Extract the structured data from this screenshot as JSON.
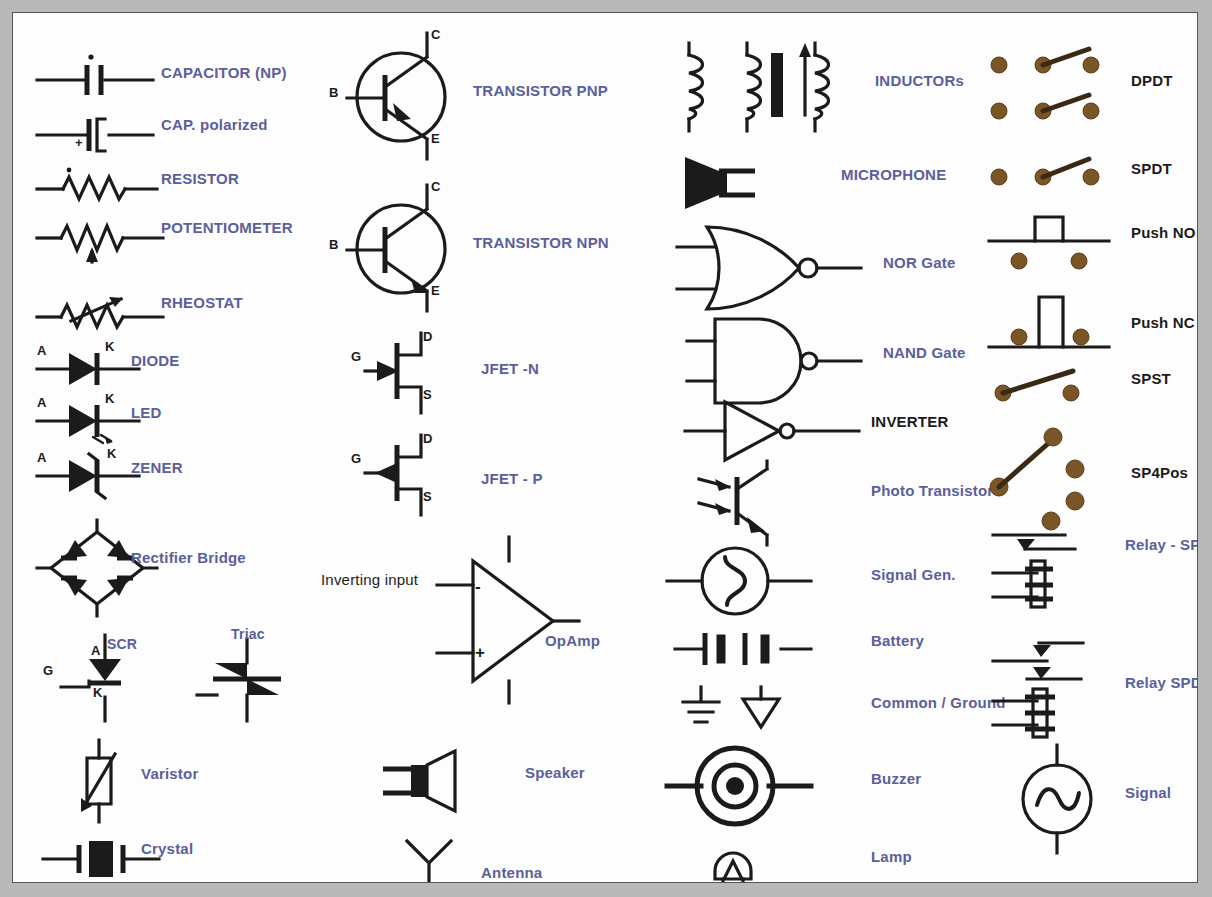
{
  "chart": {
    "accent_label_color": "#5b5f9b",
    "black_label_color": "#1b1b1b",
    "terminal_dot_color": "#7a5526",
    "background_color": "#fdfdfd",
    "page_background_color": "#b9b9b9"
  },
  "columns": [
    {
      "name": "passives-and-diodes",
      "items": [
        {
          "id": "capacitor-np",
          "label": "CAPACITOR (NP)",
          "color": "blue",
          "pins": []
        },
        {
          "id": "cap-polarized",
          "label": "CAP. polarized",
          "color": "blue",
          "pins": [
            "+"
          ]
        },
        {
          "id": "resistor",
          "label": "RESISTOR",
          "color": "blue",
          "pins": []
        },
        {
          "id": "potentiometer",
          "label": "POTENTIOMETER",
          "color": "blue",
          "pins": []
        },
        {
          "id": "rheostat",
          "label": "RHEOSTAT",
          "color": "blue",
          "pins": []
        },
        {
          "id": "diode",
          "label": "DIODE",
          "color": "blue",
          "pins": [
            "A",
            "K"
          ]
        },
        {
          "id": "led",
          "label": "LED",
          "color": "blue",
          "pins": [
            "A",
            "K"
          ]
        },
        {
          "id": "zener",
          "label": "ZENER",
          "color": "blue",
          "pins": [
            "A",
            "K"
          ]
        },
        {
          "id": "rectifier-bridge",
          "label": "Rectifier Bridge",
          "color": "blue",
          "pins": []
        },
        {
          "id": "scr",
          "label": "SCR",
          "color": "blue",
          "pins": [
            "G",
            "A",
            "K"
          ]
        },
        {
          "id": "triac",
          "label": "Triac",
          "color": "blue",
          "pins": []
        },
        {
          "id": "varistor",
          "label": "Varistor",
          "color": "blue",
          "pins": []
        },
        {
          "id": "crystal",
          "label": "Crystal",
          "color": "blue",
          "pins": []
        }
      ]
    },
    {
      "name": "transistors-and-amplifier",
      "items": [
        {
          "id": "transistor-pnp",
          "label": "TRANSISTOR PNP",
          "color": "blue",
          "pins": [
            "B",
            "C",
            "E"
          ]
        },
        {
          "id": "transistor-npn",
          "label": "TRANSISTOR NPN",
          "color": "blue",
          "pins": [
            "B",
            "C",
            "E"
          ]
        },
        {
          "id": "jfet-n",
          "label": "JFET -N",
          "color": "blue",
          "pins": [
            "G",
            "D",
            "S"
          ]
        },
        {
          "id": "jfet-p",
          "label": "JFET - P",
          "color": "blue",
          "pins": [
            "G",
            "D",
            "S"
          ]
        },
        {
          "id": "opamp",
          "label": "OpAmp",
          "color": "blue",
          "pins": [
            "-",
            "+"
          ],
          "note": "Inverting input"
        },
        {
          "id": "speaker",
          "label": "Speaker",
          "color": "blue",
          "pins": []
        },
        {
          "id": "antenna",
          "label": "Antenna",
          "color": "blue",
          "pins": []
        }
      ]
    },
    {
      "name": "magnetics-logic-sources",
      "items": [
        {
          "id": "inductors",
          "label": "INDUCTORs",
          "color": "blue",
          "pins": []
        },
        {
          "id": "microphone",
          "label": "MICROPHONE",
          "color": "blue",
          "pins": []
        },
        {
          "id": "nor-gate",
          "label": "NOR Gate",
          "color": "blue",
          "pins": []
        },
        {
          "id": "nand-gate",
          "label": "NAND Gate",
          "color": "blue",
          "pins": []
        },
        {
          "id": "inverter",
          "label": "INVERTER",
          "color": "black",
          "pins": []
        },
        {
          "id": "photo-transistor",
          "label": "Photo Transistor",
          "color": "blue",
          "pins": []
        },
        {
          "id": "signal-gen",
          "label": "Signal Gen.",
          "color": "blue",
          "pins": []
        },
        {
          "id": "battery",
          "label": "Battery",
          "color": "blue",
          "pins": []
        },
        {
          "id": "common-ground",
          "label": "Common / Ground",
          "color": "blue",
          "pins": []
        },
        {
          "id": "buzzer",
          "label": "Buzzer",
          "color": "blue",
          "pins": []
        },
        {
          "id": "lamp",
          "label": "Lamp",
          "color": "blue",
          "pins": []
        }
      ]
    },
    {
      "name": "switches-and-relays",
      "items": [
        {
          "id": "dpdt",
          "label": "DPDT",
          "color": "black",
          "pins": []
        },
        {
          "id": "spdt",
          "label": "SPDT",
          "color": "black",
          "pins": []
        },
        {
          "id": "push-no",
          "label": "Push NO",
          "color": "black",
          "pins": []
        },
        {
          "id": "push-nc",
          "label": "Push NC",
          "color": "black",
          "pins": []
        },
        {
          "id": "spst",
          "label": "SPST",
          "color": "black",
          "pins": []
        },
        {
          "id": "sp4pos",
          "label": "SP4Pos",
          "color": "black",
          "pins": []
        },
        {
          "id": "relay-spst",
          "label": "Relay - SPST",
          "color": "blue",
          "pins": []
        },
        {
          "id": "relay-spdt",
          "label": "Relay SPDT",
          "color": "blue",
          "pins": []
        },
        {
          "id": "signal",
          "label": "Signal",
          "color": "blue",
          "pins": []
        }
      ]
    }
  ]
}
